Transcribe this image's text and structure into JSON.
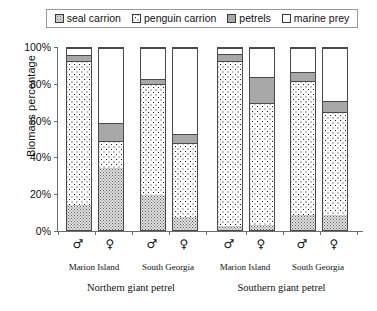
{
  "legend": {
    "items": [
      {
        "label": "seal carrion",
        "pattern": "seal",
        "swatch_name": "legend-swatch-seal-carrion"
      },
      {
        "label": "penguin carrion",
        "pattern": "penguin",
        "swatch_name": "legend-swatch-penguin-carrion"
      },
      {
        "label": "petrels",
        "pattern": "petrels",
        "swatch_name": "legend-swatch-petrels"
      },
      {
        "label": "marine prey",
        "pattern": "marine",
        "swatch_name": "legend-swatch-marine-prey"
      }
    ]
  },
  "axis": {
    "ylabel": "Biomass percentage",
    "yticks": [
      "0%",
      "20%",
      "40%",
      "60%",
      "80%",
      "100%"
    ]
  },
  "groups": {
    "sites": [
      "Marion Island",
      "South Georgia",
      "Marion Island",
      "South Georgia"
    ],
    "species": [
      "Northern giant petrel",
      "Southern giant petrel"
    ]
  },
  "chart_data": {
    "type": "bar",
    "title": "",
    "xlabel": "",
    "ylabel": "Biomass percentage",
    "ylim": [
      0,
      100
    ],
    "yticks": [
      0,
      20,
      40,
      60,
      80,
      100
    ],
    "grid": false,
    "stacked": true,
    "legend_position": "top",
    "categories": [
      "♂",
      "♀",
      "♂",
      "♀",
      "♂",
      "♀",
      "♂",
      "♀"
    ],
    "category_groups": [
      {
        "label": "Marion Island",
        "species": "Northern giant petrel",
        "bars": [
          0,
          1
        ]
      },
      {
        "label": "South Georgia",
        "species": "Northern giant petrel",
        "bars": [
          2,
          3
        ]
      },
      {
        "label": "Marion Island",
        "species": "Southern giant petrel",
        "bars": [
          4,
          5
        ]
      },
      {
        "label": "South Georgia",
        "species": "Southern giant petrel",
        "bars": [
          6,
          7
        ]
      }
    ],
    "series": [
      {
        "name": "seal carrion",
        "pattern": "seal",
        "values": [
          14,
          34,
          19,
          7,
          2,
          3,
          8,
          8
        ]
      },
      {
        "name": "penguin carrion",
        "pattern": "penguin",
        "values": [
          79,
          15,
          61,
          41,
          91,
          67,
          74,
          57
        ]
      },
      {
        "name": "petrels",
        "pattern": "petrels",
        "values": [
          3,
          10,
          3,
          5,
          4,
          14,
          5,
          6
        ]
      },
      {
        "name": "marine prey",
        "pattern": "marine",
        "values": [
          4,
          41,
          17,
          47,
          3,
          16,
          13,
          29
        ]
      }
    ]
  }
}
